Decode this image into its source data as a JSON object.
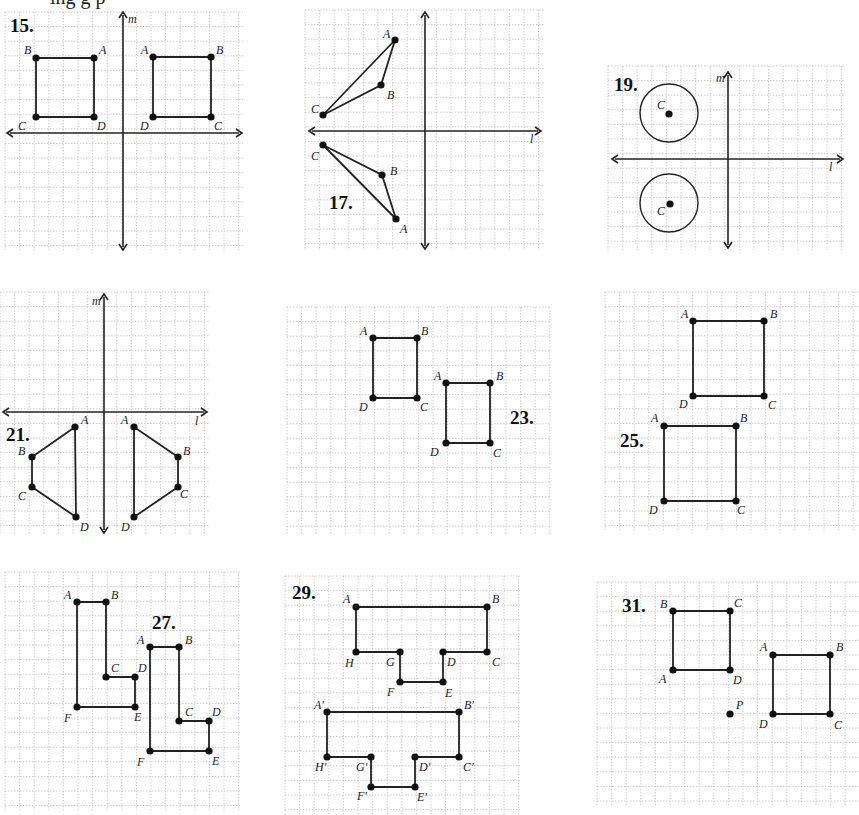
{
  "header": {
    "fragment": "ing g p"
  },
  "grid": {
    "line_color": "#b8b8b8",
    "ink_color": "#222222"
  },
  "panels": [
    {
      "id": "15",
      "label": "15.",
      "box": [
        5,
        12,
        243,
        250
      ],
      "cell": 14.6,
      "label_pos": [
        10,
        32
      ],
      "axes": {
        "vertical": {
          "x": 123,
          "y1": 12,
          "y2": 250,
          "name": "m",
          "name_pos": [
            128,
            23
          ]
        },
        "horizontal": {
          "y": 133,
          "x1": 7,
          "x2": 242,
          "name": "",
          "name_pos": null
        }
      },
      "points": [
        {
          "n": "B",
          "x": 36,
          "y": 58,
          "lx": 24,
          "ly": 54
        },
        {
          "n": "A",
          "x": 94,
          "y": 58,
          "lx": 99,
          "ly": 54
        },
        {
          "n": "D",
          "x": 94,
          "y": 117,
          "lx": 97,
          "ly": 130
        },
        {
          "n": "C",
          "x": 36,
          "y": 117,
          "lx": 18,
          "ly": 130
        },
        {
          "n": "A",
          "x": 153,
          "y": 57,
          "lx": 141,
          "ly": 54
        },
        {
          "n": "B",
          "x": 211,
          "y": 57,
          "lx": 216,
          "ly": 54
        },
        {
          "n": "C",
          "x": 211,
          "y": 117,
          "lx": 214,
          "ly": 130
        },
        {
          "n": "D",
          "x": 153,
          "y": 117,
          "lx": 140,
          "ly": 130
        }
      ],
      "polygons": [
        [
          0,
          1,
          2,
          3
        ],
        [
          4,
          5,
          6,
          7
        ]
      ],
      "circles": []
    },
    {
      "id": "17",
      "label": "17.",
      "box": [
        305,
        10,
        545,
        250
      ],
      "cell": 14.6,
      "label_pos": [
        329,
        209
      ],
      "axes": {
        "vertical": {
          "x": 425,
          "y1": 12,
          "y2": 249,
          "name": "",
          "name_pos": null
        },
        "horizontal": {
          "y": 131,
          "x1": 309,
          "x2": 541,
          "name": "l",
          "name_pos": [
            530,
            143
          ]
        }
      },
      "points": [
        {
          "n": "A",
          "x": 395,
          "y": 40,
          "lx": 383,
          "ly": 38
        },
        {
          "n": "B",
          "x": 381,
          "y": 85,
          "lx": 387,
          "ly": 99
        },
        {
          "n": "C",
          "x": 323,
          "y": 115,
          "lx": 311,
          "ly": 113
        },
        {
          "n": "C",
          "x": 323,
          "y": 145,
          "lx": 311,
          "ly": 160
        },
        {
          "n": "B",
          "x": 382,
          "y": 175,
          "lx": 390,
          "ly": 175
        },
        {
          "n": "A",
          "x": 396,
          "y": 219,
          "lx": 400,
          "ly": 233
        }
      ],
      "polygons": [
        [
          0,
          1,
          2
        ],
        [
          3,
          4,
          5
        ]
      ],
      "circles": []
    },
    {
      "id": "19",
      "label": "19.",
      "box": [
        608,
        66,
        845,
        250
      ],
      "cell": 14.6,
      "label_pos": [
        614,
        91
      ],
      "axes": {
        "vertical": {
          "x": 728,
          "y1": 72,
          "y2": 248,
          "name": "m",
          "name_pos": [
            716,
            82
          ]
        },
        "horizontal": {
          "y": 159,
          "x1": 612,
          "x2": 843,
          "name": "l",
          "name_pos": [
            829,
            171
          ]
        }
      },
      "points": [
        {
          "n": "C",
          "x": 669,
          "y": 114,
          "lx": 657,
          "ly": 109
        },
        {
          "n": "C",
          "x": 670,
          "y": 204,
          "lx": 657,
          "ly": 215
        }
      ],
      "polygons": [],
      "circles": [
        {
          "cx": 669,
          "cy": 113,
          "r": 29
        },
        {
          "cx": 669,
          "cy": 203,
          "r": 29
        }
      ]
    },
    {
      "id": "21",
      "label": "21.",
      "box": [
        0,
        292,
        210,
        535
      ],
      "cell": 14.6,
      "label_pos": [
        6,
        441
      ],
      "axes": {
        "vertical": {
          "x": 104,
          "y1": 294,
          "y2": 533,
          "name": "m",
          "name_pos": [
            92,
            305
          ]
        },
        "horizontal": {
          "y": 412,
          "x1": 3,
          "x2": 207,
          "name": "l",
          "name_pos": [
            195,
            425
          ]
        }
      },
      "points": [
        {
          "n": "A",
          "x": 75,
          "y": 427,
          "lx": 81,
          "ly": 424
        },
        {
          "n": "B",
          "x": 32,
          "y": 457,
          "lx": 18,
          "ly": 455
        },
        {
          "n": "C",
          "x": 32,
          "y": 487,
          "lx": 18,
          "ly": 500
        },
        {
          "n": "D",
          "x": 76,
          "y": 517,
          "lx": 80,
          "ly": 531
        },
        {
          "n": "A",
          "x": 134,
          "y": 427,
          "lx": 121,
          "ly": 424
        },
        {
          "n": "B",
          "x": 178,
          "y": 457,
          "lx": 183,
          "ly": 455
        },
        {
          "n": "C",
          "x": 178,
          "y": 487,
          "lx": 180,
          "ly": 498
        },
        {
          "n": "D",
          "x": 134,
          "y": 517,
          "lx": 121,
          "ly": 531
        }
      ],
      "polygons": [
        [
          0,
          1,
          2,
          3
        ],
        [
          4,
          5,
          6,
          7
        ]
      ],
      "circles": []
    },
    {
      "id": "23",
      "label": "23.",
      "box": [
        287,
        307,
        550,
        535
      ],
      "cell": 14.6,
      "label_pos": [
        510,
        424
      ],
      "axes": null,
      "points": [
        {
          "n": "A",
          "x": 373,
          "y": 338,
          "lx": 360,
          "ly": 335
        },
        {
          "n": "B",
          "x": 417,
          "y": 338,
          "lx": 421,
          "ly": 335
        },
        {
          "n": "C",
          "x": 417,
          "y": 398,
          "lx": 420,
          "ly": 411
        },
        {
          "n": "D",
          "x": 373,
          "y": 398,
          "lx": 359,
          "ly": 411
        },
        {
          "n": "A",
          "x": 446,
          "y": 383,
          "lx": 434,
          "ly": 380
        },
        {
          "n": "B",
          "x": 490,
          "y": 383,
          "lx": 496,
          "ly": 380
        },
        {
          "n": "C",
          "x": 490,
          "y": 443,
          "lx": 493,
          "ly": 457
        },
        {
          "n": "D",
          "x": 446,
          "y": 443,
          "lx": 430,
          "ly": 456
        }
      ],
      "polygons": [
        [
          0,
          1,
          2,
          3
        ],
        [
          4,
          5,
          6,
          7
        ]
      ],
      "circles": []
    },
    {
      "id": "25",
      "label": "25.",
      "box": [
        605,
        292,
        859,
        530
      ],
      "cell": 14.6,
      "label_pos": [
        620,
        447
      ],
      "axes": null,
      "points": [
        {
          "n": "A",
          "x": 693,
          "y": 321,
          "lx": 681,
          "ly": 318
        },
        {
          "n": "B",
          "x": 764,
          "y": 321,
          "lx": 770,
          "ly": 318
        },
        {
          "n": "C",
          "x": 764,
          "y": 396,
          "lx": 768,
          "ly": 409
        },
        {
          "n": "D",
          "x": 693,
          "y": 396,
          "lx": 679,
          "ly": 408
        },
        {
          "n": "A",
          "x": 664,
          "y": 426,
          "lx": 651,
          "ly": 422
        },
        {
          "n": "B",
          "x": 736,
          "y": 426,
          "lx": 740,
          "ly": 422
        },
        {
          "n": "C",
          "x": 736,
          "y": 501,
          "lx": 737,
          "ly": 514
        },
        {
          "n": "D",
          "x": 664,
          "y": 501,
          "lx": 649,
          "ly": 514
        }
      ],
      "polygons": [
        [
          0,
          1,
          2,
          3
        ],
        [
          4,
          5,
          6,
          7
        ]
      ],
      "circles": []
    },
    {
      "id": "27",
      "label": "27.",
      "box": [
        5,
        572,
        240,
        810
      ],
      "cell": 14.6,
      "label_pos": [
        152,
        629
      ],
      "axes": null,
      "points": [
        {
          "n": "A",
          "x": 77,
          "y": 602,
          "lx": 64,
          "ly": 599
        },
        {
          "n": "B",
          "x": 106,
          "y": 602,
          "lx": 111,
          "ly": 599
        },
        {
          "n": "C",
          "x": 106,
          "y": 677,
          "lx": 111,
          "ly": 672
        },
        {
          "n": "D",
          "x": 135,
          "y": 677,
          "lx": 138,
          "ly": 672
        },
        {
          "n": "E",
          "x": 135,
          "y": 707,
          "lx": 134,
          "ly": 721
        },
        {
          "n": "F",
          "x": 77,
          "y": 707,
          "lx": 64,
          "ly": 722
        },
        {
          "n": "A",
          "x": 150,
          "y": 647,
          "lx": 137,
          "ly": 644
        },
        {
          "n": "B",
          "x": 179,
          "y": 647,
          "lx": 185,
          "ly": 644
        },
        {
          "n": "C",
          "x": 179,
          "y": 721,
          "lx": 185,
          "ly": 716
        },
        {
          "n": "D",
          "x": 209,
          "y": 721,
          "lx": 212,
          "ly": 716
        },
        {
          "n": "E",
          "x": 209,
          "y": 751,
          "lx": 212,
          "ly": 765
        },
        {
          "n": "F",
          "x": 150,
          "y": 751,
          "lx": 137,
          "ly": 766
        }
      ],
      "polygons": [
        [
          0,
          1,
          2,
          3,
          4,
          5
        ],
        [
          6,
          7,
          8,
          9,
          10,
          11
        ]
      ],
      "circles": []
    },
    {
      "id": "29",
      "label": "29.",
      "box": [
        285,
        576,
        520,
        815
      ],
      "cell": 14.6,
      "label_pos": [
        292,
        599
      ],
      "axes": null,
      "points": [
        {
          "n": "A",
          "x": 356,
          "y": 607,
          "lx": 343,
          "ly": 603
        },
        {
          "n": "B",
          "x": 487,
          "y": 607,
          "lx": 492,
          "ly": 603
        },
        {
          "n": "C",
          "x": 487,
          "y": 652,
          "lx": 492,
          "ly": 666
        },
        {
          "n": "D",
          "x": 443,
          "y": 652,
          "lx": 447,
          "ly": 666
        },
        {
          "n": "E",
          "x": 443,
          "y": 682,
          "lx": 445,
          "ly": 697
        },
        {
          "n": "F",
          "x": 400,
          "y": 682,
          "lx": 387,
          "ly": 696
        },
        {
          "n": "G",
          "x": 400,
          "y": 652,
          "lx": 386,
          "ly": 666
        },
        {
          "n": "H",
          "x": 356,
          "y": 652,
          "lx": 345,
          "ly": 667
        },
        {
          "n": "A'",
          "x": 327,
          "y": 712,
          "lx": 314,
          "ly": 709
        },
        {
          "n": "B'",
          "x": 459,
          "y": 712,
          "lx": 464,
          "ly": 709
        },
        {
          "n": "C'",
          "x": 459,
          "y": 757,
          "lx": 463,
          "ly": 771
        },
        {
          "n": "D'",
          "x": 415,
          "y": 757,
          "lx": 419,
          "ly": 771
        },
        {
          "n": "E'",
          "x": 415,
          "y": 787,
          "lx": 417,
          "ly": 801
        },
        {
          "n": "F'",
          "x": 371,
          "y": 787,
          "lx": 357,
          "ly": 800
        },
        {
          "n": "G'",
          "x": 371,
          "y": 757,
          "lx": 356,
          "ly": 771
        },
        {
          "n": "H'",
          "x": 327,
          "y": 757,
          "lx": 315,
          "ly": 771
        }
      ],
      "polygons": [
        [
          0,
          1,
          2,
          3,
          4,
          5,
          6,
          7
        ],
        [
          8,
          9,
          10,
          11,
          12,
          13,
          14,
          15
        ]
      ],
      "circles": [],
      "open_edges": [
        [
          3,
          2
        ],
        [
          6,
          7
        ]
      ]
    },
    {
      "id": "31",
      "label": "31.",
      "box": [
        597,
        582,
        859,
        805
      ],
      "cell": 14.6,
      "label_pos": [
        622,
        612
      ],
      "axes": null,
      "points": [
        {
          "n": "B",
          "x": 673,
          "y": 611,
          "lx": 660,
          "ly": 608
        },
        {
          "n": "C",
          "x": 730,
          "y": 611,
          "lx": 734,
          "ly": 607
        },
        {
          "n": "D",
          "x": 730,
          "y": 670,
          "lx": 733,
          "ly": 684
        },
        {
          "n": "A",
          "x": 673,
          "y": 670,
          "lx": 659,
          "ly": 683
        },
        {
          "n": "A",
          "x": 773,
          "y": 655,
          "lx": 760,
          "ly": 651
        },
        {
          "n": "B",
          "x": 830,
          "y": 655,
          "lx": 836,
          "ly": 651
        },
        {
          "n": "C",
          "x": 830,
          "y": 714,
          "lx": 834,
          "ly": 729
        },
        {
          "n": "D",
          "x": 773,
          "y": 714,
          "lx": 759,
          "ly": 728
        },
        {
          "n": "P",
          "x": 730,
          "y": 714,
          "lx": 736,
          "ly": 709
        }
      ],
      "polygons": [
        [
          0,
          1,
          2,
          3
        ],
        [
          4,
          5,
          6,
          7
        ]
      ],
      "circles": []
    }
  ]
}
